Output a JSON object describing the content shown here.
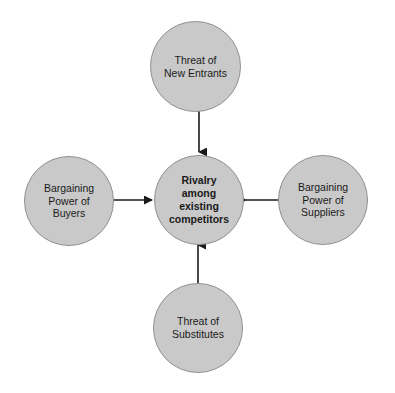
{
  "diagram": {
    "background_color": "#ffffff",
    "node_fill_color": "#c9c9c9",
    "node_border_color": "#8f8f8f",
    "arrow_color": "#1a1a1a",
    "text_color": "#1a1a1a",
    "nodes": [
      {
        "id": "threat-of-new-entrants",
        "position": "top",
        "label": "Threat of\nNew Entrants",
        "bold": false
      },
      {
        "id": "bargaining-power-of-buyers",
        "position": "left",
        "label": "Bargaining\nPower of\nBuyers",
        "bold": false
      },
      {
        "id": "rivalry-among-existing-competitors",
        "position": "center",
        "label": "Rivalry\namong\nexisting\ncompetitors",
        "bold": true
      },
      {
        "id": "bargaining-power-of-suppliers",
        "position": "right",
        "label": "Bargaining\nPower of\nSuppliers",
        "bold": false
      },
      {
        "id": "threat-of-substitutes",
        "position": "bottom",
        "label": "Threat of\nSubstitutes",
        "bold": false
      }
    ],
    "edges": [
      {
        "id": "edge-top-to-center",
        "from": "threat-of-new-entrants",
        "to": "rivalry-among-existing-competitors",
        "direction": "down"
      },
      {
        "id": "edge-left-to-center",
        "from": "bargaining-power-of-buyers",
        "to": "rivalry-among-existing-competitors",
        "direction": "right"
      },
      {
        "id": "edge-right-to-center",
        "from": "bargaining-power-of-suppliers",
        "to": "rivalry-among-existing-competitors",
        "direction": "left"
      },
      {
        "id": "edge-bottom-to-center",
        "from": "threat-of-substitutes",
        "to": "rivalry-among-existing-competitors",
        "direction": "up"
      }
    ]
  }
}
